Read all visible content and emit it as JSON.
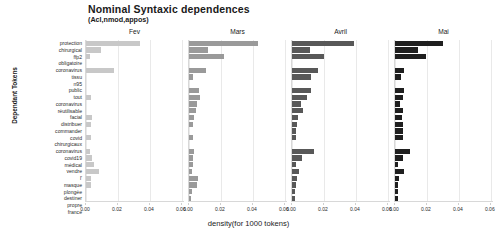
{
  "chart_data": {
    "type": "bar",
    "orientation": "horizontal",
    "facet": "column",
    "title": "Nominal Syntaxic dependences",
    "subtitle": "(Acl,nmod,appos)",
    "xlabel": "density(for 1000 tokens)",
    "ylabel": "Dependant Tokens",
    "xlim": [
      0,
      0.062
    ],
    "xticks": [
      "0.00",
      "0.02",
      "0.04",
      "0.06"
    ],
    "xtick_values": [
      0.0,
      0.02,
      0.04,
      0.06
    ],
    "grid": true,
    "legend": "none",
    "categories": [
      "protection",
      "chirurgical",
      "ffp2",
      "obligatoire",
      "coronavirus",
      "tissu",
      "n95",
      "public",
      "tout",
      "coronavirus",
      "réutilisable",
      "facial",
      "distribuer",
      "commander",
      "covid",
      "chirurgicaux",
      "coronavirus",
      "covid19",
      "médical",
      "vendre",
      "l'",
      "masque",
      "plongée",
      "destiner",
      "propre",
      "france"
    ],
    "panels": [
      {
        "label": "Fev",
        "color": "#c8c8c8",
        "values": [
          0.034,
          0.0092,
          0.0028,
          0.0,
          0.0175,
          0.0,
          0.0,
          0.0,
          0.003,
          0.0,
          0.0,
          0.0036,
          0.003,
          0.0,
          0.003,
          0.0,
          0.0022,
          0.0036,
          0.005,
          0.0082,
          0.003,
          0.003,
          0.0,
          0.0,
          0.0,
          0.0
        ]
      },
      {
        "label": "Mars",
        "color": "#9a9a9a",
        "values": [
          0.043,
          0.0118,
          0.0222,
          0.0,
          0.0104,
          0.0028,
          0.0,
          0.006,
          0.0066,
          0.0052,
          0.0046,
          0.0032,
          0.0022,
          0.0,
          0.0022,
          0.0,
          0.003,
          0.0028,
          0.0022,
          0.0016,
          0.0058,
          0.005,
          0.0016,
          0.0014,
          0.0012,
          0.0008
        ]
      },
      {
        "label": "Avril",
        "color": "#585858",
        "values": [
          0.039,
          0.0112,
          0.02,
          0.0,
          0.016,
          0.0116,
          0.0,
          0.0118,
          0.0092,
          0.0058,
          0.007,
          0.004,
          0.0034,
          0.0026,
          0.0026,
          0.0,
          0.0138,
          0.006,
          0.0028,
          0.0046,
          0.003,
          0.0022,
          0.0016,
          0.0016,
          0.0014,
          0.0012
        ]
      },
      {
        "label": "Mai",
        "color": "#1f1f1f",
        "values": [
          0.03,
          0.0142,
          0.0192,
          0.0,
          0.0058,
          0.004,
          0.0,
          0.0058,
          0.005,
          0.003,
          0.005,
          0.0044,
          0.0048,
          0.005,
          0.005,
          0.0,
          0.0092,
          0.005,
          0.002,
          0.0058,
          0.0024,
          0.002,
          0.0018,
          0.0018,
          0.003,
          0.0028
        ]
      }
    ]
  }
}
